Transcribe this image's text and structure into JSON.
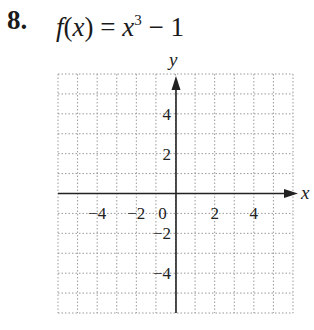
{
  "problem": {
    "number": "8.",
    "func": "f",
    "var": "x",
    "lhs_open": "(",
    "lhs_close": ")",
    "equals": " = ",
    "base": "x",
    "exponent": "3",
    "rest": " − 1"
  },
  "chart_data": {
    "type": "line",
    "xlabel": "x",
    "ylabel": "y",
    "xlim": [
      -6,
      6
    ],
    "ylim": [
      -6,
      6
    ],
    "grid": true,
    "grid_style": "dotted",
    "x_ticks": [
      "−4",
      "−2",
      "0",
      "2",
      "4"
    ],
    "y_ticks": [
      "4",
      "2",
      "−2",
      "−4"
    ],
    "series": [],
    "note": "Blank coordinate grid for graphing; no curve plotted"
  }
}
